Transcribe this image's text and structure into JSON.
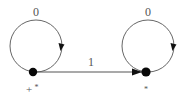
{
  "diagram": {
    "type": "state-transition-diagram",
    "background_color": "#ffffff",
    "stroke_color": "#555555",
    "node_color": "#080808",
    "width": 183,
    "height": 100,
    "nodes": [
      {
        "id": "left",
        "label_base": "+",
        "label_sup": "*",
        "label_full": "+*",
        "cx": 33,
        "cy": 72,
        "r": 4.2
      },
      {
        "id": "right",
        "label_base": "",
        "label_sup": "*",
        "label_full": "*",
        "cx": 146,
        "cy": 72,
        "r": 4.6
      }
    ],
    "self_loops": [
      {
        "id": "left-loop",
        "on_node": "left",
        "label": "0",
        "label_x": 36,
        "label_y": 14,
        "cx": 36,
        "cy": 46,
        "r": 26
      },
      {
        "id": "right-loop",
        "on_node": "right",
        "label": "0",
        "label_x": 148,
        "label_y": 14,
        "cx": 148,
        "cy": 46,
        "r": 26
      }
    ],
    "edges": [
      {
        "id": "left-to-right",
        "from": "left",
        "to": "right",
        "label": "1",
        "label_x": 91,
        "label_y": 66,
        "x1": 37,
        "y1": 72,
        "x2": 141,
        "y2": 72
      }
    ]
  }
}
